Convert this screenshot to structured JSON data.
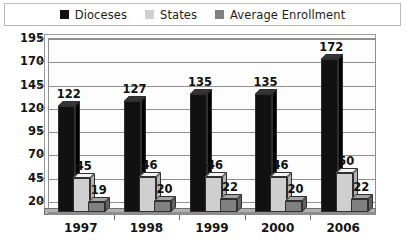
{
  "legend": {
    "entries": [
      {
        "label": "Dioceses",
        "color": "#111111",
        "swatch_name": "legend-swatch-dioceses"
      },
      {
        "label": "States",
        "color": "#cfcfcf",
        "swatch_name": "legend-swatch-states"
      },
      {
        "label": "Average Enrollment",
        "color": "#808080",
        "swatch_name": "legend-swatch-average-enrollment"
      }
    ]
  },
  "chart_data": {
    "type": "bar",
    "title": "",
    "xlabel": "",
    "ylabel": "",
    "categories": [
      "1997",
      "1998",
      "1999",
      "2000",
      "2006"
    ],
    "series": [
      {
        "name": "Dioceses",
        "color": "#111111",
        "values": [
          122,
          127,
          135,
          135,
          172
        ]
      },
      {
        "name": "States",
        "color": "#cfcfcf",
        "values": [
          45,
          46,
          46,
          46,
          50
        ]
      },
      {
        "name": "Average Enrollment",
        "color": "#808080",
        "values": [
          19,
          20,
          22,
          20,
          22
        ]
      }
    ],
    "yticks": [
      20,
      45,
      70,
      95,
      120,
      145,
      170,
      195
    ],
    "ylim": [
      8,
      195
    ],
    "grid": true,
    "legend_position": "top",
    "data_labels": true
  }
}
